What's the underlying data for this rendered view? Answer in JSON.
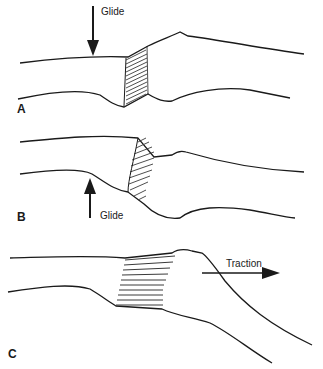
{
  "figure": {
    "panels": [
      {
        "id": "A",
        "label": "A",
        "arrow_label": "Glide",
        "arrow_direction": "down"
      },
      {
        "id": "B",
        "label": "B",
        "arrow_label": "Glide",
        "arrow_direction": "up"
      },
      {
        "id": "C",
        "label": "C",
        "arrow_label": "Traction",
        "arrow_direction": "right"
      }
    ]
  },
  "colors": {
    "line": "#1a1a1a",
    "hatch": "#3a3a3a",
    "background": "#ffffff"
  }
}
